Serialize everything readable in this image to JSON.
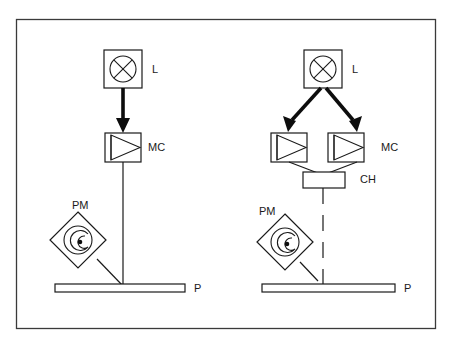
{
  "figure": {
    "frame": {
      "x": 16,
      "y": 19,
      "width": 420,
      "height": 310,
      "color": "#3a3a3a"
    },
    "ink_color": "#1a1a1a",
    "background": "#ffffff"
  },
  "labels": {
    "left_lamp": "L",
    "left_monochromator": "MC",
    "left_photomultiplier": "PM",
    "left_plate": "P",
    "right_lamp": "L",
    "right_monochromator": "MC",
    "right_chopper": "CH",
    "right_photomultiplier": "PM",
    "right_plate": "P"
  },
  "label_positions": {
    "left_lamp": {
      "x": 152,
      "y": 70
    },
    "left_monochromator": {
      "x": 148,
      "y": 148
    },
    "left_photomultiplier": {
      "x": 72,
      "y": 206
    },
    "left_plate": {
      "x": 194,
      "y": 289
    },
    "right_lamp": {
      "x": 352,
      "y": 70
    },
    "right_monochromator": {
      "x": 381,
      "y": 148
    },
    "right_chopper": {
      "x": 360,
      "y": 180
    },
    "right_photomultiplier": {
      "x": 259,
      "y": 212
    },
    "right_plate": {
      "x": 404,
      "y": 289
    }
  },
  "left_setup": {
    "name": "continuous-beam-setup",
    "lamp_box": {
      "x": 104,
      "y": 50,
      "width": 38,
      "height": 38
    },
    "lamp_circle": {
      "cx": 123,
      "cy": 69,
      "r": 13
    },
    "lamp_symbol": "crossed-circle",
    "beam_lamp_to_mc": {
      "x1": 123,
      "y1": 88,
      "x2": 123,
      "y2": 128,
      "style": "thick-arrow"
    },
    "mc_box": {
      "x": 105,
      "y": 133,
      "width": 36,
      "height": 29
    },
    "mc_symbol": "triangle-prism",
    "beam_mc_to_plate": {
      "x1": 123,
      "y1": 162,
      "x2": 123,
      "y2": 286,
      "style": "thin-solid"
    },
    "pm_diamond": {
      "cx": 78,
      "cy": 240,
      "half": 28
    },
    "pm_symbol": "spiral-with-dot",
    "pm_to_plate": {
      "x1": 96,
      "y1": 258,
      "x2": 123,
      "y2": 286,
      "style": "thin-solid"
    },
    "plate": {
      "x": 55,
      "y": 284,
      "width": 130,
      "height": 8
    }
  },
  "right_setup": {
    "name": "chopped-dual-beam-setup",
    "lamp_box": {
      "x": 304,
      "y": 50,
      "width": 38,
      "height": 38
    },
    "lamp_circle": {
      "cx": 323,
      "cy": 69,
      "r": 13
    },
    "lamp_symbol": "crossed-circle",
    "beam_left_branch": {
      "x1": 320,
      "y1": 88,
      "x2": 289,
      "y2": 126,
      "style": "thick-arrow"
    },
    "beam_right_branch": {
      "x1": 327,
      "y1": 88,
      "x2": 356,
      "y2": 126,
      "style": "thick-arrow"
    },
    "mc_box_left": {
      "x": 271,
      "y": 133,
      "width": 36,
      "height": 29
    },
    "mc_box_right": {
      "x": 328,
      "y": 133,
      "width": 36,
      "height": 29
    },
    "mc_symbol": "triangle-prism",
    "converge_left": {
      "x1": 289,
      "y1": 162,
      "x2": 323,
      "y2": 176,
      "style": "thin-solid"
    },
    "converge_right": {
      "x1": 356,
      "y1": 162,
      "x2": 323,
      "y2": 176,
      "style": "thin-solid"
    },
    "ch_box": {
      "x": 303,
      "y": 172,
      "width": 42,
      "height": 16
    },
    "beam_ch_to_plate": {
      "x1": 323,
      "y1": 188,
      "x2": 323,
      "y2": 286,
      "style": "dashed"
    },
    "pm_diamond": {
      "cx": 285,
      "cy": 242,
      "half": 28
    },
    "pm_symbol": "spiral-with-dot",
    "pm_to_plate": {
      "x1": 300,
      "y1": 262,
      "x2": 318,
      "y2": 281,
      "style": "thin-solid-short"
    },
    "plate": {
      "x": 262,
      "y": 284,
      "width": 133,
      "height": 8
    }
  }
}
